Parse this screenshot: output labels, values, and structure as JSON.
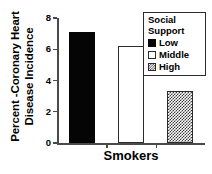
{
  "chart_data": {
    "type": "bar",
    "title": "",
    "subtitle": "",
    "xlabel": "Smokers",
    "ylabel": "Percent -Coronary Heart Disease Incidence",
    "ylabel_lines": [
      "Percent -Coronary Heart",
      "Disease Incidence"
    ],
    "categories": [
      "Smokers"
    ],
    "ylim": [
      0,
      8
    ],
    "yticks": [
      0,
      2,
      4,
      6,
      8
    ],
    "ytick_labels": [
      "0",
      "2",
      "4",
      "6",
      "8"
    ],
    "grid": false,
    "legend_position": "top-right",
    "legend_title": "Social Support",
    "series": [
      {
        "name": "Low",
        "values": [
          7.1
        ],
        "fill": "solid",
        "color": "#050505"
      },
      {
        "name": "Middle",
        "values": [
          6.2
        ],
        "fill": "open",
        "color": "#ffffff"
      },
      {
        "name": "High",
        "values": [
          3.3
        ],
        "fill": "checker",
        "color": "#3a3a3a"
      }
    ],
    "bars": [
      {
        "label": "Low",
        "value": 7.1,
        "fill": "solid"
      },
      {
        "label": "Middle",
        "value": 6.2,
        "fill": "open"
      },
      {
        "label": "High",
        "value": 3.3,
        "fill": "checker"
      }
    ],
    "axis_color": "#4a4a4a"
  },
  "legend": {
    "title_line1": "Social",
    "title_line2": "Support",
    "items": [
      {
        "label": "Low",
        "fill": "solid"
      },
      {
        "label": "Middle",
        "fill": "open"
      },
      {
        "label": "High",
        "fill": "checker"
      }
    ]
  }
}
